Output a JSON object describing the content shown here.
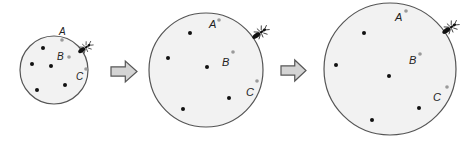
{
  "diagram": {
    "colors": {
      "circle_fill": "#f2f2f2",
      "circle_stroke": "#555555",
      "dot_black": "#111111",
      "dot_gray": "#9a9a9a",
      "arrow_fill": "#d4d4d4",
      "arrow_stroke": "#555555",
      "ant": "#111111"
    },
    "stages": [
      {
        "id": "small",
        "cx": 54,
        "cy": 70,
        "r": 34,
        "labels": [
          {
            "text": "A",
            "x": 59,
            "y": 35,
            "size": 10
          },
          {
            "text": "B",
            "x": 57,
            "y": 60,
            "size": 10
          },
          {
            "text": "C",
            "x": 76,
            "y": 80,
            "size": 10
          }
        ],
        "gray_dots": [
          [
            62,
            40
          ],
          [
            69,
            57
          ],
          [
            86,
            69
          ]
        ],
        "black_dots": [
          [
            43,
            48
          ],
          [
            32,
            64
          ],
          [
            51,
            66
          ],
          [
            37,
            90
          ],
          [
            65,
            85
          ]
        ],
        "ant": {
          "x": 85,
          "y": 48,
          "angle": 55,
          "scale": 0.8
        }
      },
      {
        "id": "medium",
        "cx": 206,
        "cy": 70,
        "r": 57,
        "labels": [
          {
            "text": "A",
            "x": 209,
            "y": 28,
            "size": 11
          },
          {
            "text": "B",
            "x": 222,
            "y": 66,
            "size": 11
          },
          {
            "text": "C",
            "x": 246,
            "y": 96,
            "size": 11
          }
        ],
        "gray_dots": [
          [
            219,
            20
          ],
          [
            233,
            52
          ],
          [
            257,
            81
          ]
        ],
        "black_dots": [
          [
            190,
            33
          ],
          [
            168,
            58
          ],
          [
            207,
            67
          ],
          [
            183,
            109
          ],
          [
            229,
            98
          ]
        ],
        "ant": {
          "x": 260,
          "y": 33,
          "angle": 55,
          "scale": 0.9
        }
      },
      {
        "id": "large",
        "cx": 390,
        "cy": 69,
        "r": 66,
        "labels": [
          {
            "text": "A",
            "x": 395,
            "y": 21,
            "size": 11
          },
          {
            "text": "B",
            "x": 409,
            "y": 64,
            "size": 11
          },
          {
            "text": "C",
            "x": 433,
            "y": 101,
            "size": 11
          }
        ],
        "gray_dots": [
          [
            406,
            11
          ],
          [
            420,
            54
          ],
          [
            447,
            87
          ]
        ],
        "black_dots": [
          [
            364,
            33
          ],
          [
            336,
            65
          ],
          [
            389,
            76
          ],
          [
            372,
            120
          ],
          [
            419,
            108
          ]
        ],
        "ant": {
          "x": 450,
          "y": 28,
          "angle": 55,
          "scale": 0.9
        }
      }
    ],
    "arrows": [
      {
        "x": 111,
        "y": 61,
        "w": 26,
        "h": 21
      },
      {
        "x": 281,
        "y": 60,
        "w": 25,
        "h": 21
      }
    ]
  }
}
